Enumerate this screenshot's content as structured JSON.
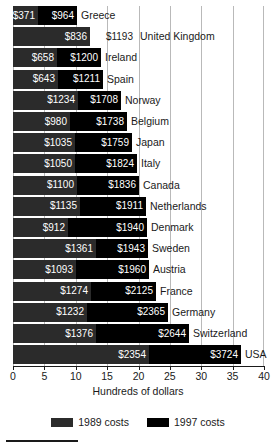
{
  "chart_data": {
    "type": "bar",
    "subtype": "stacked-horizontal",
    "title": "",
    "xlabel": "Hundreds of dollars",
    "ylabel": "",
    "xlim": [
      0,
      40
    ],
    "xticks": [
      0,
      5,
      10,
      15,
      20,
      25,
      30,
      35,
      40
    ],
    "xticklabels": [
      "0",
      "5",
      "10",
      "15",
      "20",
      "25",
      "30",
      "35",
      "40"
    ],
    "grid": true,
    "legend": {
      "position": "bottom",
      "entries": [
        {
          "name": "1989 costs",
          "color": "#2b2b2b"
        },
        {
          "name": "1997 costs",
          "color": "#000000"
        }
      ]
    },
    "categories": [
      "Greece",
      "United Kingdom",
      "Ireland",
      "Spain",
      "Norway",
      "Belgium",
      "Japan",
      "Italy",
      "Canada",
      "Netherlands",
      "Denmark",
      "Sweden",
      "Austria",
      "France",
      "Germany",
      "Switzerland",
      "USA"
    ],
    "series": [
      {
        "name": "1989 costs",
        "values": [
          371,
          836,
          658,
          643,
          1234,
          980,
          1035,
          1050,
          1100,
          1135,
          912,
          1361,
          1093,
          1274,
          1232,
          1376,
          2354
        ]
      },
      {
        "name": "1997 costs",
        "values": [
          964,
          1193,
          1200,
          1211,
          1708,
          1738,
          1759,
          1824,
          1836,
          1911,
          1940,
          1943,
          1960,
          2125,
          2365,
          2644,
          3724
        ]
      }
    ],
    "rows": [
      {
        "country": "Greece",
        "v1989": "$371",
        "v1997": "$964",
        "w1989": 25,
        "w1997": 39,
        "label1997_outside": false
      },
      {
        "country": "United Kingdom",
        "v1989": "$836",
        "v1997": "$1193",
        "w1989": 77,
        "w1997": 0,
        "label1997_outside": true
      },
      {
        "country": "Ireland",
        "v1989": "$658",
        "v1997": "$1200",
        "w1989": 44,
        "w1997": 44,
        "label1997_outside": false
      },
      {
        "country": "Spain",
        "v1989": "$643",
        "v1997": "$1211",
        "w1989": 45,
        "w1997": 45,
        "label1997_outside": false
      },
      {
        "country": "Norway",
        "v1989": "$1234",
        "v1997": "$1708",
        "w1989": 65,
        "w1997": 43,
        "label1997_outside": false
      },
      {
        "country": "Belgium",
        "v1989": "$980",
        "v1997": "$1738",
        "w1989": 57,
        "w1997": 57,
        "label1997_outside": false
      },
      {
        "country": "Japan",
        "v1989": "$1035",
        "v1997": "$1759",
        "w1989": 62,
        "w1997": 57,
        "label1997_outside": false
      },
      {
        "country": "Italy",
        "v1989": "$1050",
        "v1997": "$1824",
        "w1989": 62,
        "w1997": 62,
        "label1997_outside": false
      },
      {
        "country": "Canada",
        "v1989": "$1100",
        "v1997": "$1836",
        "w1989": 64,
        "w1997": 62,
        "label1997_outside": false
      },
      {
        "country": "Netherlands",
        "v1989": "$1135",
        "v1997": "$1911",
        "w1989": 67,
        "w1997": 66,
        "label1997_outside": false
      },
      {
        "country": "Denmark",
        "v1989": "$912",
        "v1997": "$1940",
        "w1989": 55,
        "w1997": 79,
        "label1997_outside": false
      },
      {
        "country": "Sweden",
        "v1989": "$1361",
        "v1997": "$1943",
        "w1989": 83,
        "w1997": 52,
        "label1997_outside": false
      },
      {
        "country": "Austria",
        "v1989": "$1093",
        "v1997": "$1960",
        "w1989": 63,
        "w1997": 73,
        "label1997_outside": false
      },
      {
        "country": "France",
        "v1989": "$1274",
        "v1997": "$2125",
        "w1989": 78,
        "w1997": 65,
        "label1997_outside": false
      },
      {
        "country": "Germany",
        "v1989": "$1232",
        "v1997": "$2365",
        "w1989": 74,
        "w1997": 81,
        "label1997_outside": false
      },
      {
        "country": "Switzerland",
        "v1989": "$1376",
        "v1997": "$2644",
        "w1989": 83,
        "w1997": 93,
        "label1997_outside": false
      },
      {
        "country": "USA",
        "v1989": "$2354",
        "v1997": "$3724",
        "w1989": 136,
        "w1997": 92,
        "label1997_outside": false
      }
    ]
  }
}
